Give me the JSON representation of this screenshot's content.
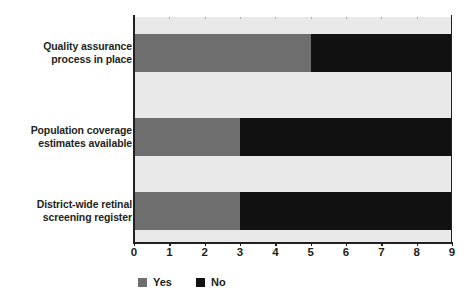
{
  "chart_data": {
    "type": "bar",
    "orientation": "horizontal",
    "stacked": true,
    "title": "",
    "xlabel": "",
    "ylabel": "",
    "xlim": [
      0,
      9
    ],
    "xticks": [
      "0",
      "1",
      "2",
      "3",
      "4",
      "5",
      "6",
      "7",
      "8",
      "9"
    ],
    "grid": true,
    "grid_axis": "x",
    "legend_position": "bottom-left",
    "categories": [
      "Quality assurance process in place",
      "Population coverage estimates available",
      "District-wide retinal screening register"
    ],
    "series": [
      {
        "name": "Yes",
        "color": "#6e6e6e",
        "values": [
          5,
          3,
          3
        ]
      },
      {
        "name": "No",
        "color": "#111111",
        "values": [
          4,
          6,
          6
        ]
      }
    ]
  },
  "categories": [
    {
      "line1": "Quality assurance",
      "line2": "process in place"
    },
    {
      "line1": "Population coverage",
      "line2": "estimates available"
    },
    {
      "line1": "District-wide retinal",
      "line2": "screening register"
    }
  ],
  "legend": [
    {
      "label": "Yes",
      "color": "#6e6e6e"
    },
    {
      "label": "No",
      "color": "#111111"
    }
  ],
  "axis": {
    "ticks": [
      "0",
      "1",
      "2",
      "3",
      "4",
      "5",
      "6",
      "7",
      "8",
      "9"
    ]
  },
  "colors": {
    "yes": "#6e6e6e",
    "no": "#111111",
    "plot_background": "#e9e9e9",
    "axis": "#231f20",
    "gridline": "#9a9a9a"
  }
}
